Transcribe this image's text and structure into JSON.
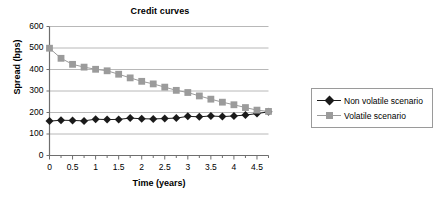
{
  "chart_data": {
    "type": "line",
    "title": "Credit curves",
    "xlabel": "Time (years)",
    "ylabel": "Spread (bps)",
    "xlim": [
      0,
      4.75
    ],
    "ylim": [
      0,
      600
    ],
    "grid": "horizontal",
    "legend_position": "right",
    "x_ticks": [
      "0",
      "0.5",
      "1",
      "1.5",
      "2",
      "2.5",
      "3",
      "3.5",
      "4",
      "4.5"
    ],
    "x_tick_values": [
      0,
      0.5,
      1,
      1.5,
      2,
      2.5,
      3,
      3.5,
      4,
      4.5
    ],
    "x_minor_step": 0.25,
    "y_ticks": [
      "0",
      "100",
      "200",
      "300",
      "400",
      "500",
      "600"
    ],
    "y_tick_values": [
      0,
      100,
      200,
      300,
      400,
      500,
      600
    ],
    "x": [
      0,
      0.25,
      0.5,
      0.75,
      1,
      1.25,
      1.5,
      1.75,
      2,
      2.25,
      2.5,
      2.75,
      3,
      3.25,
      3.5,
      3.75,
      4,
      4.25,
      4.5,
      4.75
    ],
    "series": [
      {
        "name": "Non volatile scenario",
        "marker": "diamond",
        "color": "#1a1a1a",
        "values": [
          160,
          164,
          163,
          161,
          169,
          167,
          168,
          174,
          171,
          170,
          172,
          174,
          182,
          180,
          184,
          181,
          184,
          188,
          195,
          203
        ]
      },
      {
        "name": "Volatile scenario",
        "marker": "square",
        "color": "#9b9b9b",
        "values": [
          499,
          452,
          424,
          411,
          401,
          394,
          378,
          361,
          345,
          333,
          318,
          303,
          293,
          277,
          262,
          248,
          236,
          223,
          211,
          205
        ]
      }
    ]
  },
  "legend": {
    "items": [
      {
        "label": "Non volatile scenario"
      },
      {
        "label": "Volatile scenario"
      }
    ]
  },
  "colors": {
    "series_non_volatile": "#1a1a1a",
    "series_volatile": "#9b9b9b",
    "grid": "#a6a6a6",
    "axis": "#6e6e6e",
    "legend_border": "#9a9a9a",
    "background": "#ffffff"
  }
}
